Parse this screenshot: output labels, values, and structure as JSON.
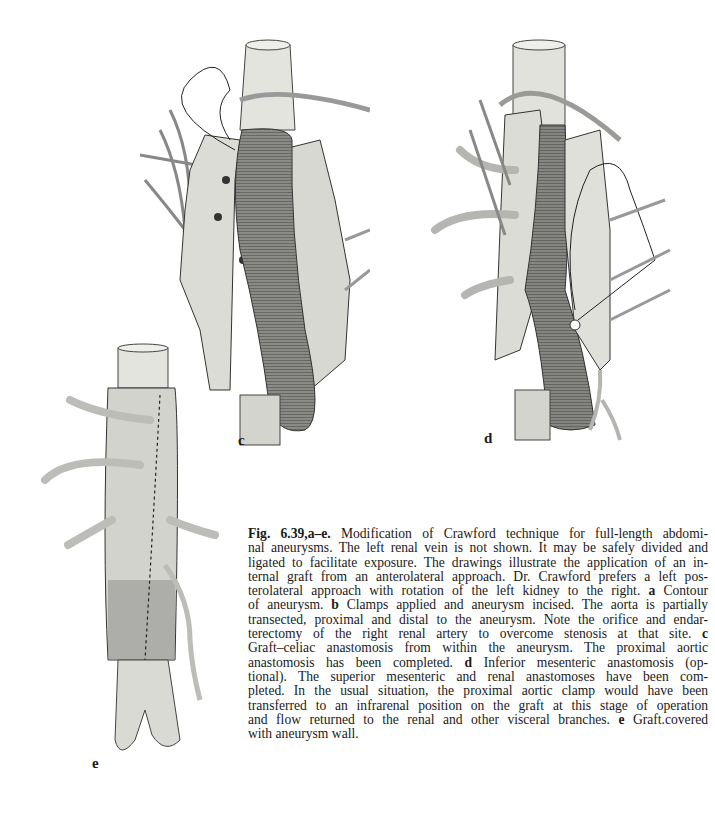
{
  "figure": {
    "number": "Fig. 6.39,a–e.",
    "panels": [
      {
        "id": "c",
        "label": "c",
        "description": "Graft–celiac anastomosis from within the aneurysm, proximal aortic anastomosis completed"
      },
      {
        "id": "d",
        "label": "d",
        "description": "Inferior mesenteric anastomosis"
      },
      {
        "id": "e",
        "label": "e",
        "description": "Graft covered with aneurysm wall"
      }
    ],
    "caption_lines": [
      {
        "parts": [
          {
            "b": "Fig. 6.39,a–e."
          },
          {
            "t": "   Modification of Crawford technique for full-length abdomi-"
          }
        ]
      },
      {
        "parts": [
          {
            "t": "nal aneurysms. The left renal vein is not shown. It may be safely divided and"
          }
        ]
      },
      {
        "parts": [
          {
            "t": "ligated to facilitate exposure. The drawings illustrate the application of an in-"
          }
        ]
      },
      {
        "parts": [
          {
            "t": "ternal graft from an anterolateral approach. Dr. Crawford prefers a left pos-"
          }
        ]
      },
      {
        "parts": [
          {
            "t": "terolateral approach with rotation of the left kidney to the right. "
          },
          {
            "b": "a"
          },
          {
            "t": " Contour"
          }
        ]
      },
      {
        "parts": [
          {
            "t": "of aneurysm. "
          },
          {
            "b": "b"
          },
          {
            "t": " Clamps applied and aneurysm incised. The aorta is partially"
          }
        ]
      },
      {
        "parts": [
          {
            "t": "transected, proximal and distal to the aneurysm. Note the orifice and endar-"
          }
        ]
      },
      {
        "parts": [
          {
            "t": "terectomy of the right renal artery to overcome stenosis at that site. "
          },
          {
            "b": "c"
          }
        ]
      },
      {
        "parts": [
          {
            "t": "Graft–celiac  anastomosis from within the aneurysm. The proximal aortic"
          }
        ]
      },
      {
        "parts": [
          {
            "t": "anastomosis has been completed. "
          },
          {
            "b": "d"
          },
          {
            "t": " Inferior mesenteric anastomosis (op-"
          }
        ]
      },
      {
        "parts": [
          {
            "t": "tional). The superior mesenteric and renal anastomoses have been com-"
          }
        ]
      },
      {
        "parts": [
          {
            "t": "pleted. In the usual situation, the proximal aortic clamp would have been"
          }
        ]
      },
      {
        "parts": [
          {
            "t": "transferred to an infrarenal position on the graft at this stage of operation"
          }
        ]
      },
      {
        "parts": [
          {
            "t": "and flow returned to the renal and other visceral branches. "
          },
          {
            "b": "e"
          },
          {
            "t": " Graft.covered"
          }
        ]
      },
      {
        "parts": [
          {
            "t": "with aneurysm wall."
          }
        ],
        "last": true
      }
    ]
  },
  "colors": {
    "paper": "#ffffff",
    "ink": "#1a1a1a",
    "tissue_light": "#e6e6e2",
    "tissue_mid": "#c9c9c4",
    "graft_dark": "#7d7d7a",
    "vessel": "#b8b8b4"
  }
}
